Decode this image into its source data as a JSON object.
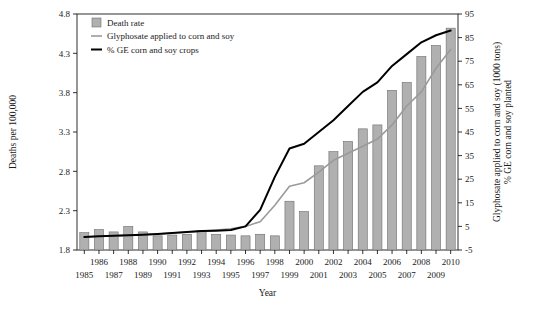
{
  "chart_data": {
    "type": "bar",
    "title": "",
    "xlabel": "Year",
    "ylabel_left": "Deaths per 100,000",
    "ylabel_right": "Glyphosate applied to corn and soy (1000 tons)\n% GE corn and soy planted",
    "ylabel_right_line1": "Glyphosate applied to corn and soy (1000 tons)",
    "ylabel_right_line2": "% GE corn and soy planted",
    "categories": [
      1985,
      1986,
      1987,
      1988,
      1989,
      1990,
      1991,
      1992,
      1993,
      1994,
      1995,
      1996,
      1997,
      1998,
      1999,
      2000,
      2001,
      2002,
      2003,
      2004,
      2005,
      2006,
      2007,
      2008,
      2009,
      2010
    ],
    "x_tick_labels_top": [
      "",
      "1986",
      "",
      "1988",
      "",
      "1990",
      "",
      "1992",
      "",
      "1994",
      "",
      "1996",
      "",
      "1998",
      "",
      "2000",
      "",
      "2002",
      "",
      "2004",
      "",
      "2006",
      "",
      "2008",
      "",
      "2010"
    ],
    "x_tick_labels_bottom": [
      "1985",
      "",
      "1987",
      "",
      "1989",
      "",
      "1991",
      "",
      "1993",
      "",
      "1995",
      "",
      "1997",
      "",
      "1999",
      "",
      "2001",
      "",
      "2003",
      "",
      "2005",
      "",
      "2007",
      "",
      "2009",
      ""
    ],
    "y_left_ticks": [
      1.8,
      2.3,
      2.8,
      3.3,
      3.8,
      4.3,
      4.8
    ],
    "ylim_left": [
      1.8,
      4.8
    ],
    "y_right_ticks": [
      -5,
      5,
      15,
      25,
      35,
      45,
      55,
      65,
      75,
      85,
      95
    ],
    "ylim_right": [
      -5,
      95
    ],
    "grid": false,
    "legend_position": "top-left",
    "series": [
      {
        "name": "Death rate",
        "type": "bar",
        "axis": "left",
        "color": "#b0b0b0",
        "values": [
          2.02,
          2.06,
          2.03,
          2.1,
          2.03,
          1.98,
          1.99,
          2.0,
          2.05,
          2.0,
          1.99,
          1.98,
          2.0,
          1.98,
          2.42,
          2.29,
          2.87,
          3.05,
          3.18,
          3.34,
          3.39,
          3.83,
          3.93,
          4.26,
          4.4,
          4.62
        ]
      },
      {
        "name": "Glyphosate applied to corn and soy",
        "type": "line",
        "axis": "right",
        "color": "#9a9a9a",
        "values": [
          0.5,
          0.8,
          1.0,
          1.2,
          1.5,
          1.8,
          2.2,
          2.6,
          3.0,
          3.5,
          4.0,
          5.0,
          7.0,
          14.0,
          22.0,
          23.5,
          28.0,
          33.0,
          36.0,
          39.0,
          42.0,
          48.0,
          56.0,
          62.0,
          72.0,
          80.0
        ]
      },
      {
        "name": "% GE corn and soy crops",
        "type": "line",
        "axis": "right",
        "color": "#000000",
        "values": [
          0.5,
          0.8,
          1.0,
          1.2,
          1.5,
          1.8,
          2.2,
          2.6,
          3.0,
          3.2,
          3.5,
          5.0,
          12.0,
          26.0,
          38.0,
          40.0,
          45.0,
          50.0,
          56.0,
          62.0,
          66.0,
          73.0,
          78.0,
          83.0,
          86.0,
          88.0
        ]
      }
    ],
    "legend": [
      {
        "label": "Death rate",
        "marker": "square",
        "color": "#b0b0b0"
      },
      {
        "label": "Glyphosate applied to corn and soy",
        "marker": "line",
        "color": "#9a9a9a"
      },
      {
        "label": "% GE corn and soy crops",
        "marker": "line",
        "color": "#000000"
      }
    ]
  }
}
